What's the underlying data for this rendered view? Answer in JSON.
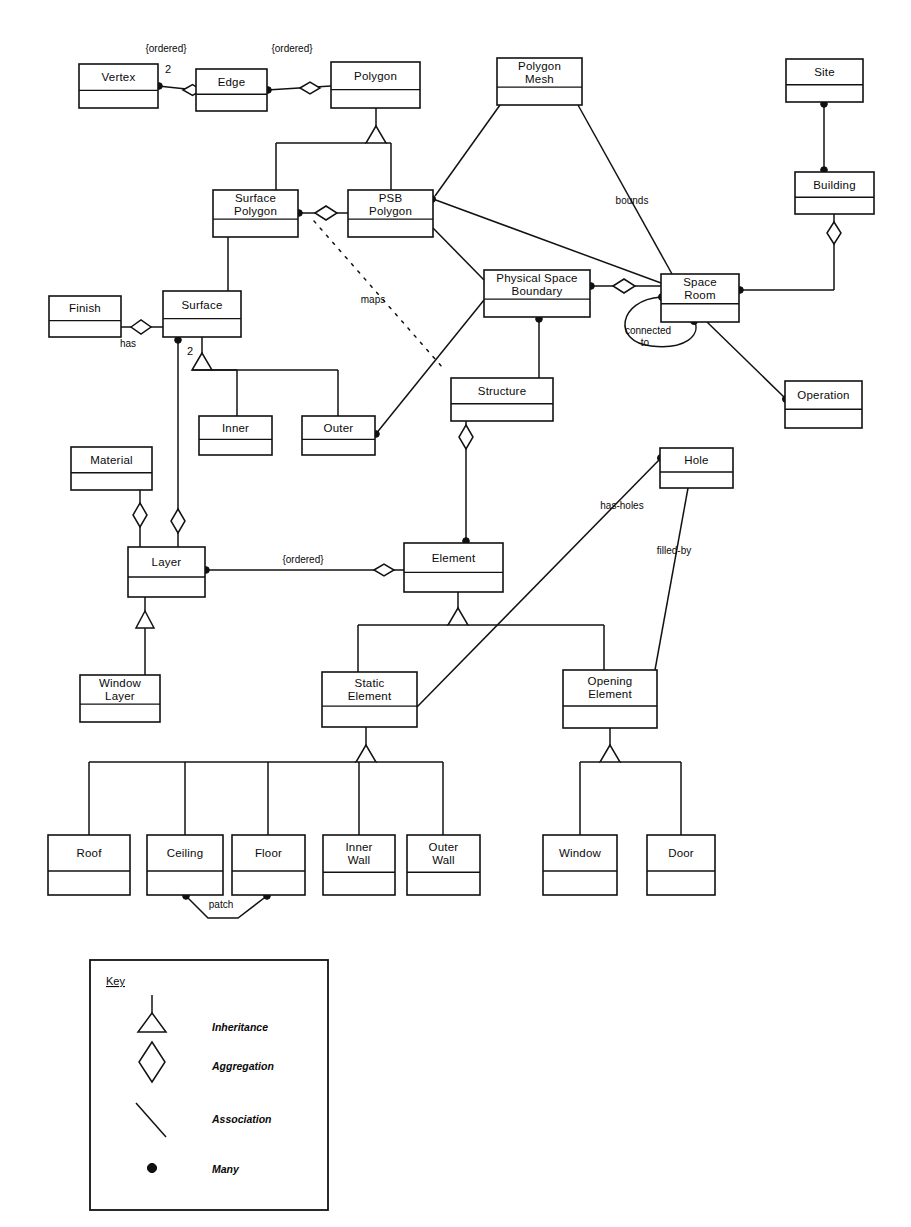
{
  "diagram": {
    "type": "uml-class-diagram",
    "title": "",
    "classes": [
      {
        "id": "vertex",
        "label": "Vertex",
        "lines": [
          "Vertex"
        ],
        "x": 79,
        "y": 64,
        "w": 79,
        "h": 44
      },
      {
        "id": "edge",
        "label": "Edge",
        "lines": [
          "Edge"
        ],
        "x": 196,
        "y": 69,
        "w": 71,
        "h": 42
      },
      {
        "id": "polygon",
        "label": "Polygon",
        "lines": [
          "Polygon"
        ],
        "x": 331,
        "y": 62,
        "w": 89,
        "h": 46
      },
      {
        "id": "polygon_mesh",
        "label": "Polygon Mesh",
        "lines": [
          "Polygon",
          "Mesh"
        ],
        "x": 497,
        "y": 58,
        "w": 85,
        "h": 47
      },
      {
        "id": "site",
        "label": "Site",
        "lines": [
          "Site"
        ],
        "x": 786,
        "y": 59,
        "w": 77,
        "h": 43
      },
      {
        "id": "surface_polygon",
        "label": "Surface Polygon",
        "lines": [
          "Surface",
          "Polygon"
        ],
        "x": 213,
        "y": 190,
        "w": 85,
        "h": 47
      },
      {
        "id": "psb_polygon",
        "label": "PSB Polygon",
        "lines": [
          "PSB",
          "Polygon"
        ],
        "x": 348,
        "y": 190,
        "w": 85,
        "h": 47
      },
      {
        "id": "building",
        "label": "Building",
        "lines": [
          "Building"
        ],
        "x": 795,
        "y": 172,
        "w": 79,
        "h": 42
      },
      {
        "id": "finish",
        "label": "Finish",
        "lines": [
          "Finish"
        ],
        "x": 49,
        "y": 296,
        "w": 72,
        "h": 41
      },
      {
        "id": "surface",
        "label": "Surface",
        "lines": [
          "Surface"
        ],
        "x": 163,
        "y": 291,
        "w": 78,
        "h": 46
      },
      {
        "id": "psb",
        "label": "Physical Space Boundary",
        "lines": [
          "Physical Space",
          "Boundary"
        ],
        "x": 484,
        "y": 270,
        "w": 106,
        "h": 47
      },
      {
        "id": "space_room",
        "label": "Space Room",
        "lines": [
          "Space",
          "Room"
        ],
        "x": 661,
        "y": 274,
        "w": 78,
        "h": 48
      },
      {
        "id": "structure",
        "label": "Structure",
        "lines": [
          "Structure"
        ],
        "x": 451,
        "y": 378,
        "w": 102,
        "h": 43
      },
      {
        "id": "operation",
        "label": "Operation",
        "lines": [
          "Operation"
        ],
        "x": 785,
        "y": 381,
        "w": 77,
        "h": 47
      },
      {
        "id": "inner",
        "label": "Inner",
        "lines": [
          "Inner"
        ],
        "x": 199,
        "y": 416,
        "w": 73,
        "h": 39
      },
      {
        "id": "outer",
        "label": "Outer",
        "lines": [
          "Outer"
        ],
        "x": 302,
        "y": 416,
        "w": 73,
        "h": 39
      },
      {
        "id": "material",
        "label": "Material",
        "lines": [
          "Material"
        ],
        "x": 71,
        "y": 447,
        "w": 81,
        "h": 43
      },
      {
        "id": "hole",
        "label": "Hole",
        "lines": [
          "Hole"
        ],
        "x": 660,
        "y": 448,
        "w": 73,
        "h": 40
      },
      {
        "id": "layer",
        "label": "Layer",
        "lines": [
          "Layer"
        ],
        "x": 128,
        "y": 547,
        "w": 77,
        "h": 50
      },
      {
        "id": "element",
        "label": "Element",
        "lines": [
          "Element"
        ],
        "x": 404,
        "y": 543,
        "w": 99,
        "h": 49
      },
      {
        "id": "window_layer",
        "label": "Window Layer",
        "lines": [
          "Window",
          "Layer"
        ],
        "x": 80,
        "y": 675,
        "w": 80,
        "h": 47
      },
      {
        "id": "static_element",
        "label": "Static Element",
        "lines": [
          "Static",
          "Element"
        ],
        "x": 322,
        "y": 672,
        "w": 95,
        "h": 55
      },
      {
        "id": "opening_element",
        "label": "Opening Element",
        "lines": [
          "Opening",
          "Element"
        ],
        "x": 563,
        "y": 670,
        "w": 94,
        "h": 58
      },
      {
        "id": "roof",
        "label": "Roof",
        "lines": [
          "Roof"
        ],
        "x": 48,
        "y": 835,
        "w": 82,
        "h": 60
      },
      {
        "id": "ceiling",
        "label": "Ceiling",
        "lines": [
          "Ceiling"
        ],
        "x": 147,
        "y": 835,
        "w": 76,
        "h": 60
      },
      {
        "id": "floor",
        "label": "Floor",
        "lines": [
          "Floor"
        ],
        "x": 232,
        "y": 835,
        "w": 73,
        "h": 60
      },
      {
        "id": "inner_wall",
        "label": "Inner Wall",
        "lines": [
          "Inner",
          "Wall"
        ],
        "x": 323,
        "y": 835,
        "w": 72,
        "h": 60
      },
      {
        "id": "outer_wall",
        "label": "Outer Wall",
        "lines": [
          "Outer",
          "Wall"
        ],
        "x": 407,
        "y": 835,
        "w": 73,
        "h": 60
      },
      {
        "id": "window",
        "label": "Window",
        "lines": [
          "Window"
        ],
        "x": 543,
        "y": 835,
        "w": 74,
        "h": 60
      },
      {
        "id": "door",
        "label": "Door",
        "lines": [
          "Door"
        ],
        "x": 647,
        "y": 835,
        "w": 68,
        "h": 60
      }
    ],
    "edge_labels": [
      {
        "id": "ordered_vertex_edge",
        "text": "{ordered}",
        "x": 166,
        "y": 52
      },
      {
        "id": "ordered_edge_poly",
        "text": "{ordered}",
        "x": 292,
        "y": 52
      },
      {
        "id": "mult_vertex",
        "text": "2",
        "x": 168,
        "y": 73
      },
      {
        "id": "bounds",
        "text": "bounds",
        "x": 632,
        "y": 204
      },
      {
        "id": "maps",
        "text": "maps",
        "x": 373,
        "y": 303
      },
      {
        "id": "has",
        "text": "has",
        "x": 128,
        "y": 347
      },
      {
        "id": "mult_surface",
        "text": "2",
        "x": 190,
        "y": 355
      },
      {
        "id": "connected_to_1",
        "text": "connected",
        "x": 648,
        "y": 334
      },
      {
        "id": "connected_to_2",
        "text": "to",
        "x": 645,
        "y": 346
      },
      {
        "id": "has_holes",
        "text": "has-holes",
        "x": 622,
        "y": 509
      },
      {
        "id": "filled_by",
        "text": "filled-by",
        "x": 674,
        "y": 554
      },
      {
        "id": "ordered_layer",
        "text": "{ordered}",
        "x": 303,
        "y": 563
      },
      {
        "id": "patch",
        "text": "patch",
        "x": 221,
        "y": 908
      }
    ],
    "key": {
      "title": "Key",
      "x": 90,
      "y": 960,
      "w": 238,
      "h": 250,
      "items": [
        {
          "id": "inheritance",
          "symbol": "triangle",
          "label": "Inheritance"
        },
        {
          "id": "aggregation",
          "symbol": "diamond",
          "label": "Aggregation"
        },
        {
          "id": "association",
          "symbol": "line",
          "label": "Association"
        },
        {
          "id": "many",
          "symbol": "dot",
          "label": "Many"
        }
      ]
    },
    "colors": {
      "stroke": "#121212",
      "fill": "#ffffff",
      "text": "#0a0a0a"
    }
  }
}
